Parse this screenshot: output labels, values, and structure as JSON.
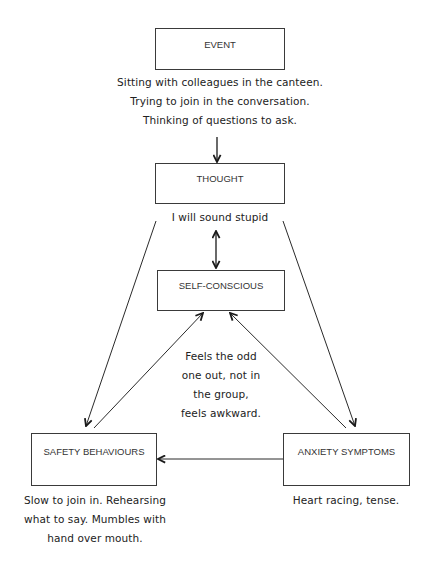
{
  "diagram": {
    "nodes": {
      "event": {
        "label": "EVENT",
        "caption": "Sitting with colleagues in the canteen.\nTrying to join in the conversation.\nThinking of questions to ask."
      },
      "thought": {
        "label": "THOUGHT",
        "caption": "I will sound stupid"
      },
      "self_conscious": {
        "label": "SELF-CONSCIOUS",
        "caption": "Feels the odd\none out, not in\nthe group,\nfeels awkward."
      },
      "safety_behaviours": {
        "label": "SAFETY BEHAVIOURS",
        "caption": "Slow to join in. Rehearsing\nwhat to say. Mumbles with\nhand over mouth."
      },
      "anxiety_symptoms": {
        "label": "ANXIETY SYMPTOMS",
        "caption": "Heart racing, tense."
      }
    },
    "edges": [
      {
        "from": "EVENT",
        "to": "THOUGHT",
        "type": "one-way"
      },
      {
        "from": "THOUGHT",
        "to": "SELF-CONSCIOUS",
        "type": "two-way"
      },
      {
        "from": "THOUGHT",
        "to": "SAFETY BEHAVIOURS",
        "type": "one-way"
      },
      {
        "from": "THOUGHT",
        "to": "ANXIETY SYMPTOMS",
        "type": "one-way"
      },
      {
        "from": "SAFETY BEHAVIOURS",
        "to": "SELF-CONSCIOUS",
        "type": "two-way"
      },
      {
        "from": "ANXIETY SYMPTOMS",
        "to": "SELF-CONSCIOUS",
        "type": "two-way"
      },
      {
        "from": "ANXIETY SYMPTOMS",
        "to": "SAFETY BEHAVIOURS",
        "type": "one-way"
      }
    ],
    "colors": {
      "line": "#2a2a2a",
      "box_border": "#3a3a3a",
      "text": "#222222"
    }
  }
}
